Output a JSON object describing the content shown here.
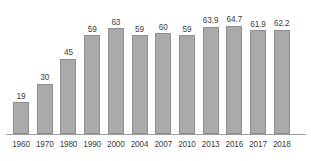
{
  "chart_data": {
    "type": "bar",
    "title": "",
    "subtitle": "",
    "xlabel": "",
    "ylabel": "",
    "categories": [
      "1960",
      "1970",
      "1980",
      "1990",
      "2000",
      "2004",
      "2007",
      "2010",
      "2013",
      "2016",
      "2017",
      "2018"
    ],
    "values": [
      19,
      30,
      45,
      59,
      63,
      59,
      60,
      59,
      63.9,
      64.7,
      61.9,
      62.2
    ],
    "value_labels": [
      "19",
      "30",
      "45",
      "59",
      "63",
      "59",
      "60",
      "59",
      "63.9",
      "64.7",
      "61.9",
      "62.2"
    ],
    "ylim": [
      0,
      68
    ],
    "grid": false,
    "legend": null,
    "annotations": [],
    "series": [
      {
        "name": "",
        "values": [
          19,
          30,
          45,
          59,
          63,
          59,
          60,
          59,
          63.9,
          64.7,
          61.9,
          62.2
        ]
      }
    ]
  },
  "style": {
    "bar_fill": "#aaaaaa",
    "bar_stroke": "#8f8f8f",
    "axis_color": "#9a9a9a",
    "label_color": "#3c3c3c",
    "background": "#ffffff"
  }
}
